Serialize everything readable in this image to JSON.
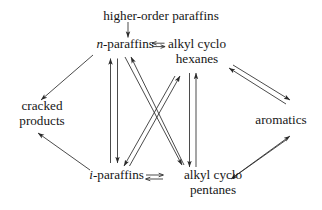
{
  "diagram": {
    "title": "Reaction network of paraffin reforming",
    "background_color": "#ffffff",
    "line_color": "#2a2a2a",
    "text_color": "#161616",
    "nodes": [
      {
        "id": "higher-order-paraffins",
        "label": "higher-order paraffins",
        "lines": [
          "higher-order paraffins"
        ]
      },
      {
        "id": "n-paraffins",
        "label": "n-paraffins",
        "italic_prefix": "n",
        "rest": "-paraffins",
        "lines": [
          "n-paraffins"
        ]
      },
      {
        "id": "alkyl-cyclo-hexanes",
        "label": "alkyl cyclo hexanes",
        "lines": [
          "alkyl cyclo",
          "hexanes"
        ]
      },
      {
        "id": "cracked-products",
        "label": "cracked products",
        "lines": [
          "cracked",
          "products"
        ]
      },
      {
        "id": "aromatics",
        "label": "aromatics",
        "lines": [
          "aromatics"
        ]
      },
      {
        "id": "i-paraffins",
        "label": "i-paraffins",
        "italic_prefix": "i",
        "rest": "-paraffins",
        "lines": [
          "i-paraffins"
        ]
      },
      {
        "id": "alkyl-cyclo-pentanes",
        "label": "alkyl cyclo pentanes",
        "lines": [
          "alkyl cyclo",
          "pentanes"
        ]
      }
    ],
    "edges": [
      {
        "id": "higher-to-n-paraffins",
        "from": "higher-order-paraffins",
        "to": "n-paraffins",
        "kind": "single"
      },
      {
        "id": "n-paraffins-eq-hexanes",
        "from": "n-paraffins",
        "to": "alkyl-cyclo-hexanes",
        "kind": "equilibrium"
      },
      {
        "id": "n-paraffins-to-cracked",
        "from": "n-paraffins",
        "to": "cracked-products",
        "kind": "single"
      },
      {
        "id": "i-paraffins-to-cracked",
        "from": "i-paraffins",
        "to": "cracked-products",
        "kind": "single"
      },
      {
        "id": "n-paraffins-i-paraffins",
        "from": "n-paraffins",
        "to": "i-paraffins",
        "kind": "reversible-pair"
      },
      {
        "id": "hexanes-pentanes",
        "from": "alkyl-cyclo-hexanes",
        "to": "alkyl-cyclo-pentanes",
        "kind": "reversible-pair"
      },
      {
        "id": "n-paraffins-pentanes",
        "from": "n-paraffins",
        "to": "alkyl-cyclo-pentanes",
        "kind": "reversible-pair"
      },
      {
        "id": "hexanes-i-paraffins",
        "from": "alkyl-cyclo-hexanes",
        "to": "i-paraffins",
        "kind": "reversible-pair"
      },
      {
        "id": "hexanes-aromatics",
        "from": "alkyl-cyclo-hexanes",
        "to": "aromatics",
        "kind": "reversible-pair"
      },
      {
        "id": "pentanes-aromatics",
        "from": "alkyl-cyclo-pentanes",
        "to": "aromatics",
        "kind": "reversible-pair"
      },
      {
        "id": "i-paraffins-eq-pentanes",
        "from": "i-paraffins",
        "to": "alkyl-cyclo-pentanes",
        "kind": "equilibrium"
      }
    ]
  }
}
